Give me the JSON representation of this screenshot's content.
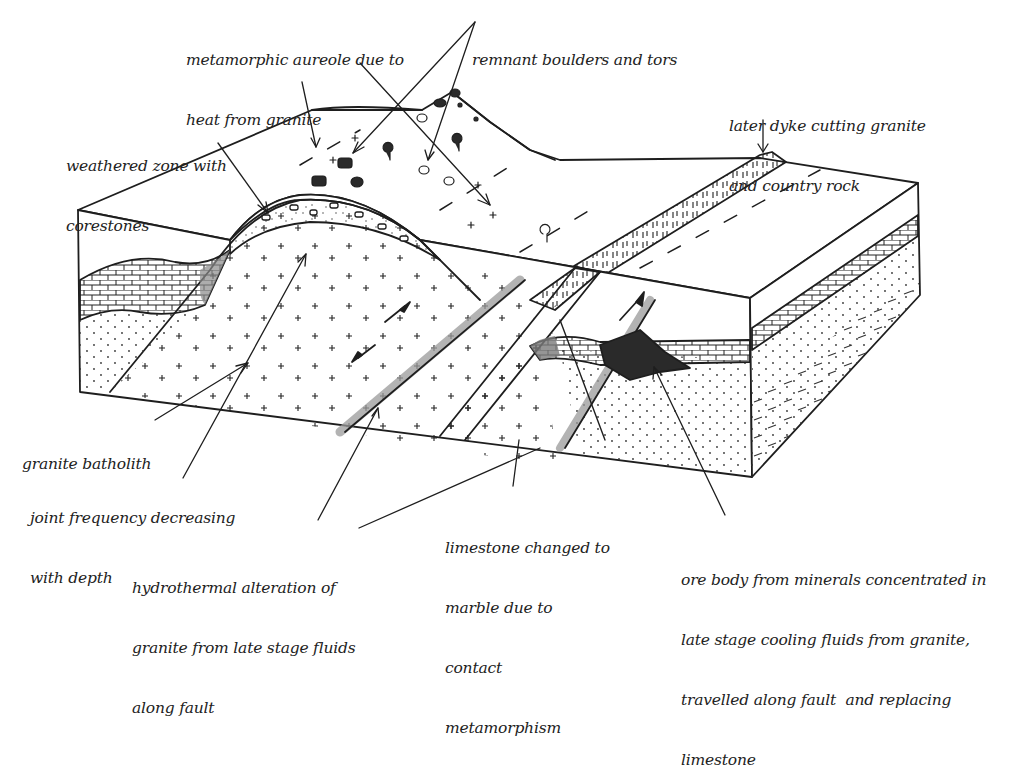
{
  "diagram": {
    "type": "geological block diagram",
    "colors": {
      "ink": "#1e1e1e",
      "background": "#ffffff",
      "alteration_shading": "#9a9a9a",
      "ore_body": "#2a2a2a",
      "marble_shading": "#7a7a7a"
    },
    "labels": [
      {
        "id": "metamorphic-aureole",
        "lines": [
          "metamorphic aureole due to",
          "heat from granite"
        ]
      },
      {
        "id": "remnant-boulders",
        "lines": [
          "remnant boulders and tors"
        ]
      },
      {
        "id": "later-dyke",
        "lines": [
          "later dyke cutting granite",
          "and country rock"
        ]
      },
      {
        "id": "weathered-zone",
        "lines": [
          "weathered zone with",
          "corestones"
        ]
      },
      {
        "id": "granite-batholith",
        "lines": [
          "granite batholith"
        ]
      },
      {
        "id": "joint-frequency",
        "lines": [
          "joint frequency decreasing",
          "with depth"
        ]
      },
      {
        "id": "hydrothermal-alteration",
        "lines": [
          "hydrothermal alteration of",
          "granite from late stage fluids",
          "along fault"
        ]
      },
      {
        "id": "limestone-marble",
        "lines": [
          "limestone changed to",
          "marble due to",
          "contact",
          "metamorphism"
        ]
      },
      {
        "id": "ore-body",
        "lines": [
          "ore body from minerals concentrated in",
          "late stage cooling fluids from granite,",
          "travelled along fault  and replacing",
          "limestone"
        ]
      }
    ]
  }
}
